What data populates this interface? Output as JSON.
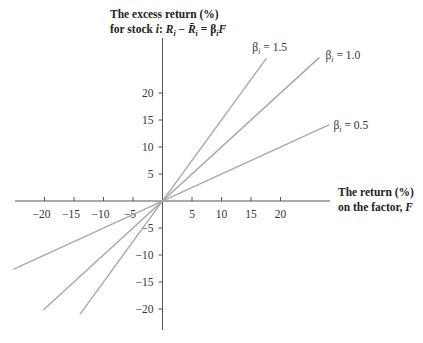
{
  "chart_data": {
    "type": "line",
    "title": "",
    "ylabel_lines": [
      "The excess return (%)",
      "for stock i: R_i − R̄_i = β_i F"
    ],
    "ylabel": {
      "line1": "The excess return (%)",
      "line2_prefix": "for stock ",
      "line2_var": "i",
      "line2_colon": ": ",
      "R": "R",
      "sub_i": "i",
      "minus": " − ",
      "Rbar": "R̄",
      "eq": " = β",
      "F": "F"
    },
    "xlabel": {
      "line1": "The return (%)",
      "line2_prefix": "on the factor, ",
      "line2_var": "F"
    },
    "x_ticks": [
      -20,
      -15,
      -10,
      -5,
      5,
      10,
      15,
      20
    ],
    "y_ticks": [
      20,
      15,
      10,
      5,
      -5,
      -10,
      -15,
      -20
    ],
    "xlim": [
      -25.3,
      28.5
    ],
    "ylim": [
      -24,
      30
    ],
    "grid": false,
    "series": [
      {
        "name": "β_i = 1.5",
        "beta": 1.5,
        "x_range": [
          -14,
          17.6
        ],
        "label_prefix": "β",
        "label_sub": "i",
        "label_value": " = 1.5"
      },
      {
        "name": "β_i = 1.0",
        "beta": 1.0,
        "x_range": [
          -20.2,
          26.6
        ],
        "label_prefix": "β",
        "label_sub": "i",
        "label_value": " = 1.0"
      },
      {
        "name": "β_i = 0.5",
        "beta": 0.5,
        "x_range": [
          -25.3,
          28.3
        ],
        "label_prefix": "β",
        "label_sub": "i",
        "label_value": " = 0.5"
      }
    ]
  }
}
